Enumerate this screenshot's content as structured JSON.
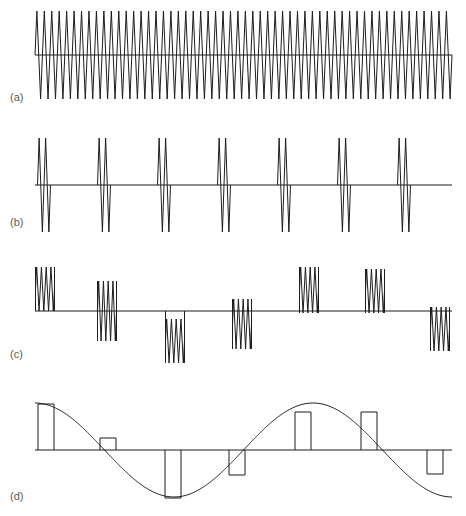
{
  "figure": {
    "background": "#ffffff",
    "stroke_color": "#1d1d1d",
    "label_color": "#5a5a5a",
    "width": 466,
    "height": 516
  },
  "panels": [
    {
      "id": "a",
      "label": "(a)",
      "label_x": 10,
      "label_y": 101,
      "caption_text": "(a)",
      "type": "continuous-carrier",
      "baseline_y": 55,
      "x_start": 35,
      "x_end": 452,
      "amplitude": 44,
      "cycles": 56
    },
    {
      "id": "b",
      "label": "(b)",
      "label_x": 10,
      "label_y": 226,
      "caption_text": "(b)",
      "type": "uniform-burst-train",
      "baseline_y": 185,
      "x_start": 35,
      "x_end": 452,
      "amplitude": 47,
      "burst_cycles": 2,
      "burst_width": 13,
      "burst_count": 7,
      "burst_centers": [
        44,
        104,
        164,
        224,
        284,
        344,
        404
      ]
    },
    {
      "id": "c",
      "label": "(c)",
      "label_x": 10,
      "label_y": 358,
      "caption_text": "(c)",
      "type": "sampled-burst-train",
      "baseline_y": 311,
      "x_start": 35,
      "x_end": 452,
      "burst_cycles": 4,
      "burst_width": 19,
      "burst_count": 7,
      "burst_centers": [
        45,
        107,
        175,
        242,
        309,
        375,
        440
      ],
      "burst_top": [
        -44,
        -30,
        8,
        -12,
        -44,
        -42,
        -4
      ],
      "burst_bottom": [
        0,
        30,
        52,
        38,
        2,
        2,
        40
      ]
    },
    {
      "id": "d",
      "label": "(d)",
      "label_x": 10,
      "label_y": 500,
      "caption_text": "(d)",
      "type": "pam-pulses-over-sine",
      "baseline_y": 450,
      "x_start": 35,
      "x_end": 452,
      "sine_amplitude": 47,
      "sine_periods": 1.5,
      "sine_phase_deg": 90,
      "pulse_count": 7,
      "pulse_width": 16,
      "pulse_left": [
        38,
        100,
        165,
        229,
        295,
        361,
        427
      ],
      "pulse_height": [
        -46,
        -12,
        48,
        25,
        -38,
        -38,
        24
      ]
    }
  ]
}
